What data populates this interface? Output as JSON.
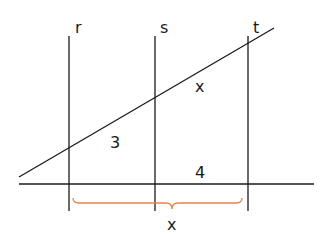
{
  "diagram": {
    "lines": {
      "r": {
        "label": "r"
      },
      "s": {
        "label": "s"
      },
      "t": {
        "label": "t"
      }
    },
    "segment_labels": {
      "upper_left": "3",
      "upper_right": "x",
      "lower_right": "4",
      "brace": "x"
    },
    "colors": {
      "line": "#1a1a1a",
      "brace": "#e8824a"
    }
  }
}
